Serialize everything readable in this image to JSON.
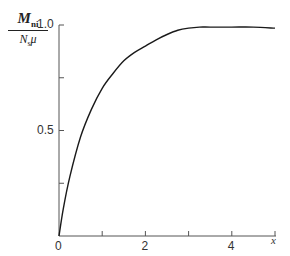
{
  "chart_data": {
    "type": "line",
    "title": "",
    "xlabel": "x",
    "ylabel": "M_ni / (N_s μ)",
    "ylabel_numerator": "M",
    "ylabel_numerator_sub": "ni",
    "ylabel_denominator": "N",
    "ylabel_denominator_sub": "s",
    "ylabel_denominator_tail": "μ",
    "xlim": [
      0,
      5
    ],
    "ylim": [
      0,
      1.0
    ],
    "x_ticks": [
      0,
      1,
      2,
      3,
      4,
      5
    ],
    "x_tick_labels": [
      "0",
      "",
      "2",
      "",
      "4",
      "x"
    ],
    "y_ticks": [
      0,
      0.25,
      0.5,
      0.75,
      1.0
    ],
    "y_tick_labels": [
      "",
      "",
      "0.5",
      "",
      "1.0"
    ],
    "grid": false,
    "legend": null,
    "series": [
      {
        "name": "M_ni / N_s μ",
        "x": [
          0,
          0.1,
          0.25,
          0.5,
          0.75,
          1.0,
          1.25,
          1.5,
          1.75,
          2.0,
          2.25,
          2.5,
          2.75,
          3.0,
          3.25,
          3.5,
          4.0,
          4.5,
          5.0
        ],
        "values": [
          0,
          0.13,
          0.28,
          0.47,
          0.6,
          0.7,
          0.77,
          0.83,
          0.87,
          0.9,
          0.93,
          0.955,
          0.975,
          0.985,
          0.99,
          0.99,
          0.99,
          0.99,
          0.985
        ]
      }
    ]
  }
}
